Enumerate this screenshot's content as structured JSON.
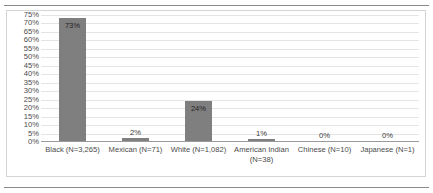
{
  "page": {
    "top_caption_partial": "",
    "bottom_rule": "horizontal-rule"
  },
  "chart_data": {
    "type": "bar",
    "title": "",
    "subtitle": "",
    "xlabel": "",
    "ylabel": "",
    "ylim": [
      0,
      75
    ],
    "grid": true,
    "legend": "none",
    "orientation": "vertical",
    "bar_color": "#7F7F7F",
    "categories": [
      "Black (N=3,265)",
      "Mexican (N=71)",
      "White (N=1,082)",
      "American Indian (N=38)",
      "Chinese (N=10)",
      "Japanese (N=1)"
    ],
    "category_lines": [
      {
        "line1": "Black (N=3,265)",
        "line2": ""
      },
      {
        "line1": "Mexican (N=71)",
        "line2": ""
      },
      {
        "line1": "White (N=1,082)",
        "line2": ""
      },
      {
        "line1": "American Indian",
        "line2": "(N=38)"
      },
      {
        "line1": "Chinese (N=10)",
        "line2": ""
      },
      {
        "line1": "Japanese (N=1)",
        "line2": ""
      }
    ],
    "values": [
      73,
      2,
      24,
      1,
      0,
      0
    ],
    "data_labels": [
      "73%",
      "2%",
      "24%",
      "1%",
      "0%",
      "0%"
    ],
    "label_placement": [
      "inside",
      "outside",
      "inside",
      "outside",
      "outside",
      "outside"
    ],
    "yticks": [
      75,
      70,
      65,
      60,
      55,
      50,
      45,
      40,
      35,
      30,
      25,
      20,
      15,
      10,
      5,
      0
    ],
    "ytick_labels": [
      "75%",
      "70%",
      "65%",
      "60%",
      "55%",
      "50%",
      "45%",
      "40%",
      "35%",
      "30%",
      "25%",
      "20%",
      "15%",
      "10%",
      "5%",
      "0%"
    ]
  }
}
